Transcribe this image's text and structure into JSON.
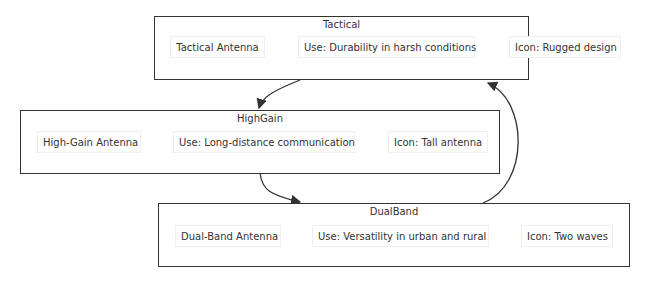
{
  "diagram": {
    "clusters": [
      {
        "id": "tactical",
        "title": "Tactical",
        "nodes": [
          "Tactical Antenna",
          "Use: Durability in harsh conditions",
          "Icon: Rugged design"
        ]
      },
      {
        "id": "highgain",
        "title": "HighGain",
        "nodes": [
          "High-Gain Antenna",
          "Use: Long-distance communication",
          "Icon: Tall antenna"
        ]
      },
      {
        "id": "dualband",
        "title": "DualBand",
        "nodes": [
          "Dual-Band Antenna",
          "Use: Versatility in urban and rural",
          "Icon: Two waves"
        ]
      }
    ],
    "edges": [
      {
        "from": "Tactical",
        "to": "HighGain"
      },
      {
        "from": "HighGain",
        "to": "DualBand"
      },
      {
        "from": "DualBand",
        "to": "Tactical"
      }
    ]
  }
}
